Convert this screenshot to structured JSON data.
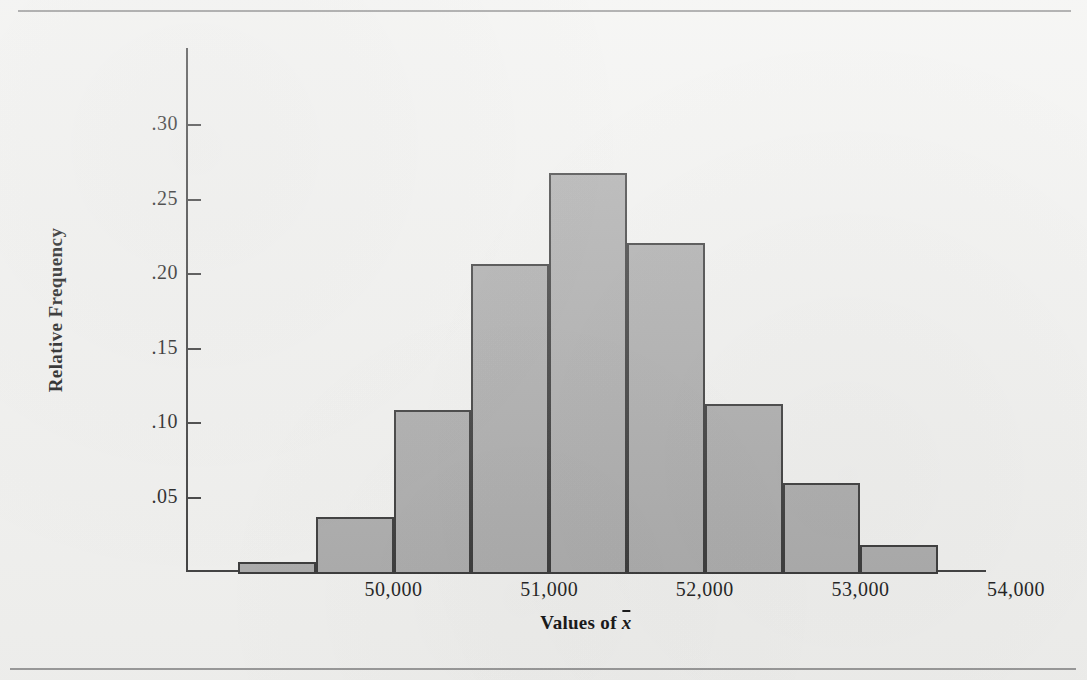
{
  "figure": {
    "background_color": "#f1f1ef",
    "bar_fill_color": "#a9a9a9",
    "bar_edge_color": "#333333",
    "axis_color": "#3a3a3a"
  },
  "chart_data": {
    "type": "bar",
    "title": "",
    "subtitle": "",
    "xlabel": "Values of x̄",
    "ylabel": "Relative Frequency",
    "grid": false,
    "legend": null,
    "xlim": [
      49000,
      54000
    ],
    "ylim": [
      0,
      0.335
    ],
    "bin_width": 500,
    "x_tick_labels": [
      "50,000",
      "51,000",
      "52,000",
      "53,000",
      "54,000"
    ],
    "x_tick_values": [
      50000,
      51000,
      52000,
      53000,
      54000
    ],
    "y_tick_labels": [
      ".30",
      ".25",
      ".20",
      ".15",
      ".10",
      ".05"
    ],
    "y_tick_values": [
      0.3,
      0.25,
      0.2,
      0.15,
      0.1,
      0.05
    ],
    "bins": [
      {
        "left": 49000,
        "right": 49500,
        "value": 0.007
      },
      {
        "left": 49500,
        "right": 50000,
        "value": 0.037
      },
      {
        "left": 50000,
        "right": 50500,
        "value": 0.109
      },
      {
        "left": 50500,
        "right": 51000,
        "value": 0.207
      },
      {
        "left": 51000,
        "right": 51500,
        "value": 0.268
      },
      {
        "left": 51500,
        "right": 52000,
        "value": 0.221
      },
      {
        "left": 52000,
        "right": 52500,
        "value": 0.113
      },
      {
        "left": 52500,
        "right": 53000,
        "value": 0.06
      },
      {
        "left": 53000,
        "right": 53500,
        "value": 0.018
      }
    ],
    "categories": [
      "49,000-49,500",
      "49,500-50,000",
      "50,000-50,500",
      "50,500-51,000",
      "51,000-51,500",
      "51,500-52,000",
      "52,000-52,500",
      "52,500-53,000",
      "53,000-53,500"
    ],
    "values": [
      0.007,
      0.037,
      0.109,
      0.207,
      0.268,
      0.221,
      0.113,
      0.06,
      0.018
    ]
  }
}
